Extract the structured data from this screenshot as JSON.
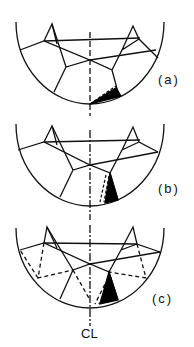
{
  "figure": {
    "panels": [
      {
        "id": "a",
        "label": "(a)"
      },
      {
        "id": "b",
        "label": "(b)"
      },
      {
        "id": "c",
        "label": "(c)"
      }
    ],
    "centerline_label": "CL",
    "colors": {
      "stroke": "#111111",
      "fill_wedge": "#000000",
      "background": "#ffffff"
    }
  }
}
